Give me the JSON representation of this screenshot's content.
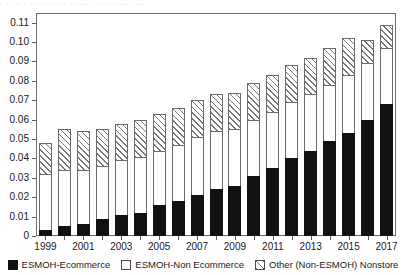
{
  "top_remnant": {
    "text": "· ·· ·· · ····· ·· ··· ······ ···· ······· ····"
  },
  "chart_data": {
    "type": "bar",
    "subtype": "stacked-vertical",
    "title": "",
    "subtitle": "",
    "xlabel": "",
    "ylabel": "",
    "grid": false,
    "legend_position": "bottom-center",
    "ylim": [
      0,
      0.115
    ],
    "ytick_values": [
      0,
      0.01,
      0.02,
      0.03,
      0.04,
      0.05,
      0.06,
      0.07,
      0.08,
      0.09,
      0.1,
      0.11
    ],
    "ytick_labels": [
      "0",
      "0.01",
      "0.02",
      "0.03",
      "0.04",
      "0.05",
      "0.06",
      "0.07",
      "0.08",
      "0.09",
      "0.10",
      "0.11"
    ],
    "categories": [
      "1999",
      "2000",
      "2001",
      "2002",
      "2003",
      "2004",
      "2005",
      "2006",
      "2007",
      "2008",
      "2009",
      "2010",
      "2011",
      "2012",
      "2013",
      "2014",
      "2015",
      "2016",
      "2017"
    ],
    "xtick_labels_shown": [
      "1999",
      "2001",
      "2003",
      "2005",
      "2007",
      "2009",
      "2011",
      "2013",
      "2015",
      "2017"
    ],
    "series": [
      {
        "name": "ESMOH-Ecommerce",
        "swatch": "black",
        "color": "#111111",
        "values": [
          0.003,
          0.005,
          0.006,
          0.009,
          0.011,
          0.012,
          0.016,
          0.018,
          0.021,
          0.024,
          0.026,
          0.031,
          0.035,
          0.04,
          0.044,
          0.049,
          0.053,
          0.06,
          0.068
        ]
      },
      {
        "name": "ESMOH-Non Ecommerce",
        "swatch": "white",
        "color": "#ffffff",
        "values": [
          0.029,
          0.029,
          0.028,
          0.027,
          0.028,
          0.029,
          0.028,
          0.029,
          0.03,
          0.03,
          0.029,
          0.029,
          0.029,
          0.029,
          0.029,
          0.029,
          0.03,
          0.029,
          0.029
        ]
      },
      {
        "name": "Other (Non-ESMOH) Nonstore",
        "swatch": "hatch",
        "color": "#ffffff",
        "values": [
          0.016,
          0.021,
          0.02,
          0.019,
          0.019,
          0.019,
          0.019,
          0.019,
          0.019,
          0.019,
          0.019,
          0.019,
          0.019,
          0.019,
          0.019,
          0.019,
          0.019,
          0.012,
          0.012
        ]
      }
    ],
    "totals": [
      0.048,
      0.055,
      0.054,
      0.055,
      0.058,
      0.06,
      0.063,
      0.066,
      0.07,
      0.073,
      0.074,
      0.079,
      0.083,
      0.088,
      0.092,
      0.097,
      0.102,
      0.101,
      0.109
    ]
  },
  "legend": {
    "entries": [
      {
        "label": "ESMOH-Ecommerce"
      },
      {
        "label": "ESMOH-Non Ecommerce"
      },
      {
        "label": "Other (Non-ESMOH) Nonstore"
      }
    ]
  }
}
